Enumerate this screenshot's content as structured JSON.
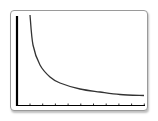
{
  "window": {
    "name": "graphing-calculator-screen"
  },
  "chart_data": {
    "type": "line",
    "title": "",
    "xlabel": "",
    "ylabel": "",
    "grid": false,
    "x_tick_count": 10,
    "series": [
      {
        "name": "curve",
        "color": "#333333",
        "points_px": [
          [
            30,
            15
          ],
          [
            33,
            45
          ],
          [
            40,
            65
          ],
          [
            50,
            77
          ],
          [
            60,
            83
          ],
          [
            80,
            89
          ],
          [
            100,
            92
          ],
          [
            120,
            94.5
          ],
          [
            144,
            95.5
          ]
        ]
      }
    ]
  },
  "colors": {
    "axis": "#000000",
    "curve": "#333333",
    "frame": "#9a9a9a"
  }
}
